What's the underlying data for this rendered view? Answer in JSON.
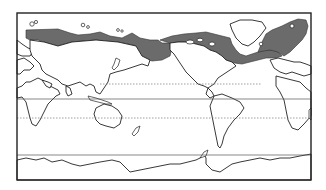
{
  "map": {
    "projection": "world map, Pacific-centered",
    "frame": {
      "x": 17,
      "y": 13,
      "width": 294,
      "height": 167
    },
    "colors": {
      "shaded_region": "#6b6b6b",
      "land": "#ffffff",
      "outline": "#222222",
      "background": "#ffffff"
    },
    "latitude_lines": [
      {
        "name": "tropic-of-cancer",
        "y": 84,
        "style": "dotted"
      },
      {
        "name": "equator",
        "y": 99,
        "style": "solid"
      },
      {
        "name": "tropic-of-capricorn",
        "y": 118,
        "style": "dotted"
      },
      {
        "name": "antarctic-circle",
        "y": 155,
        "style": "solid"
      }
    ],
    "shaded_regions": [
      "northern-siberia-coast",
      "bering-sea-north-pacific",
      "canadian-arctic-archipelago",
      "hudson-bay-labrador",
      "north-atlantic-greenland-norway"
    ]
  }
}
